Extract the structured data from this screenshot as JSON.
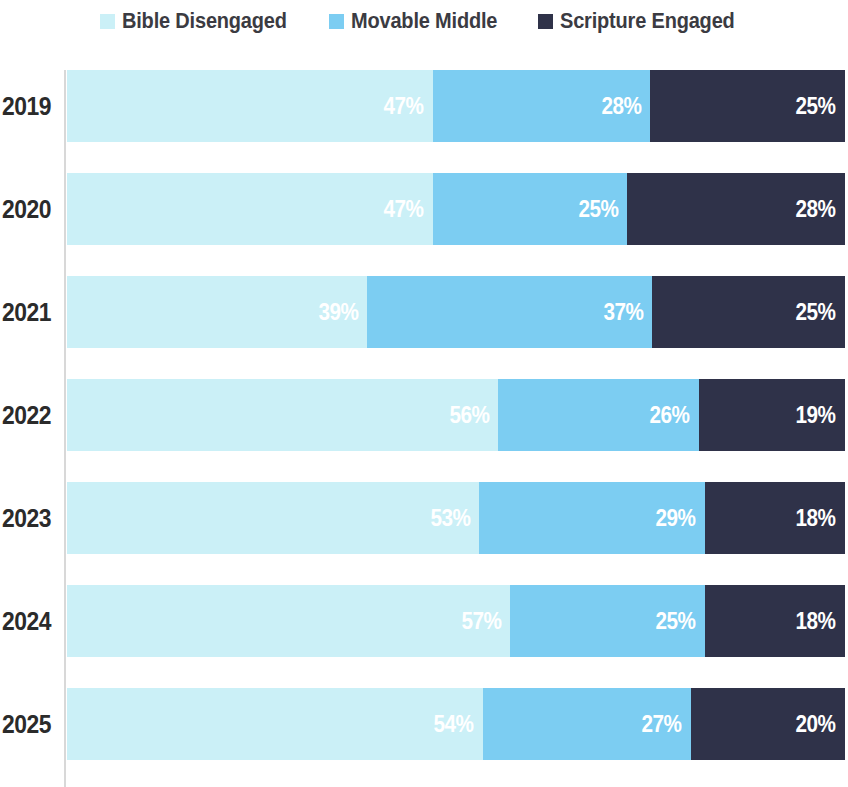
{
  "legend": {
    "items": [
      {
        "label": "Bible Disengaged",
        "color": "#cbf0f7",
        "key": "bible_disengaged"
      },
      {
        "label": "Movable Middle",
        "color": "#7ccdf2",
        "key": "movable_middle"
      },
      {
        "label": "Scripture Engaged",
        "color": "#2f3249",
        "key": "scripture_engaged"
      }
    ]
  },
  "chart_data": {
    "type": "bar",
    "orientation": "horizontal",
    "stacked": true,
    "stack_total": 100,
    "title": "",
    "subtitle": "",
    "xlabel": "",
    "ylabel": "",
    "xlim": [
      0,
      100
    ],
    "grid": false,
    "legend_position": "top",
    "value_suffix": "%",
    "categories": [
      "2019",
      "2020",
      "2021",
      "2022",
      "2023",
      "2024",
      "2025"
    ],
    "series": [
      {
        "name": "Bible Disengaged",
        "color": "#cbf0f7",
        "values": [
          47,
          47,
          39,
          56,
          53,
          57,
          54
        ]
      },
      {
        "name": "Movable Middle",
        "color": "#7ccdf2",
        "values": [
          28,
          25,
          37,
          26,
          29,
          25,
          27
        ]
      },
      {
        "name": "Scripture Engaged",
        "color": "#2f3249",
        "values": [
          25,
          28,
          25,
          19,
          18,
          18,
          20
        ]
      }
    ],
    "rows": [
      {
        "category": "2019",
        "segments": [
          {
            "series": "Bible Disengaged",
            "value": 47,
            "label": "47%",
            "color": "#cbf0f7"
          },
          {
            "series": "Movable Middle",
            "value": 28,
            "label": "28%",
            "color": "#7ccdf2"
          },
          {
            "series": "Scripture Engaged",
            "value": 25,
            "label": "25%",
            "color": "#2f3249"
          }
        ]
      },
      {
        "category": "2020",
        "segments": [
          {
            "series": "Bible Disengaged",
            "value": 47,
            "label": "47%",
            "color": "#cbf0f7"
          },
          {
            "series": "Movable Middle",
            "value": 25,
            "label": "25%",
            "color": "#7ccdf2"
          },
          {
            "series": "Scripture Engaged",
            "value": 28,
            "label": "28%",
            "color": "#2f3249"
          }
        ]
      },
      {
        "category": "2021",
        "segments": [
          {
            "series": "Bible Disengaged",
            "value": 39,
            "label": "39%",
            "color": "#cbf0f7"
          },
          {
            "series": "Movable Middle",
            "value": 37,
            "label": "37%",
            "color": "#7ccdf2"
          },
          {
            "series": "Scripture Engaged",
            "value": 25,
            "label": "25%",
            "color": "#2f3249"
          }
        ]
      },
      {
        "category": "2022",
        "segments": [
          {
            "series": "Bible Disengaged",
            "value": 56,
            "label": "56%",
            "color": "#cbf0f7"
          },
          {
            "series": "Movable Middle",
            "value": 26,
            "label": "26%",
            "color": "#7ccdf2"
          },
          {
            "series": "Scripture Engaged",
            "value": 19,
            "label": "19%",
            "color": "#2f3249"
          }
        ]
      },
      {
        "category": "2023",
        "segments": [
          {
            "series": "Bible Disengaged",
            "value": 53,
            "label": "53%",
            "color": "#cbf0f7"
          },
          {
            "series": "Movable Middle",
            "value": 29,
            "label": "29%",
            "color": "#7ccdf2"
          },
          {
            "series": "Scripture Engaged",
            "value": 18,
            "label": "18%",
            "color": "#2f3249"
          }
        ]
      },
      {
        "category": "2024",
        "segments": [
          {
            "series": "Bible Disengaged",
            "value": 57,
            "label": "57%",
            "color": "#cbf0f7"
          },
          {
            "series": "Movable Middle",
            "value": 25,
            "label": "25%",
            "color": "#7ccdf2"
          },
          {
            "series": "Scripture Engaged",
            "value": 18,
            "label": "18%",
            "color": "#2f3249"
          }
        ]
      },
      {
        "category": "2025",
        "segments": [
          {
            "series": "Bible Disengaged",
            "value": 54,
            "label": "54%",
            "color": "#cbf0f7"
          },
          {
            "series": "Movable Middle",
            "value": 27,
            "label": "27%",
            "color": "#7ccdf2"
          },
          {
            "series": "Scripture Engaged",
            "value": 20,
            "label": "20%",
            "color": "#2f3249"
          }
        ]
      }
    ]
  },
  "axis": {
    "line_color": "#d8d8d8"
  }
}
